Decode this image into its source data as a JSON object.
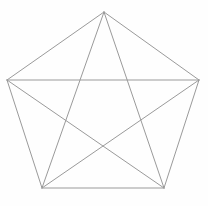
{
  "figure": {
    "shape_name": "pentagon-with-diagonals",
    "graph_name": "K5",
    "background_color": "#fefefe",
    "line_color": "#9a9a9a",
    "line_width": 1,
    "canvas": {
      "width": 208,
      "height": 206
    }
  },
  "chart_data": {
    "type": "diagram",
    "grid": false,
    "legend": null,
    "xlim": [
      0,
      208
    ],
    "ylim": [
      0,
      206
    ],
    "vertex_count": 5,
    "edge_count": 10,
    "side_count": 5,
    "diagonal_count": 5,
    "vertices": [
      {
        "id": "A",
        "label": "apex",
        "x": 104,
        "y": 12
      },
      {
        "id": "B",
        "label": "right",
        "x": 199,
        "y": 80
      },
      {
        "id": "C",
        "label": "bottom-right",
        "x": 164,
        "y": 188
      },
      {
        "id": "D",
        "label": "bottom-left",
        "x": 42,
        "y": 188
      },
      {
        "id": "E",
        "label": "left",
        "x": 7,
        "y": 80
      }
    ],
    "edges": [
      {
        "id": "side-AB",
        "kind": "side",
        "from": "A",
        "to": "B",
        "x1": 104,
        "y1": 12,
        "x2": 199,
        "y2": 80
      },
      {
        "id": "side-BC",
        "kind": "side",
        "from": "B",
        "to": "C",
        "x1": 199,
        "y1": 80,
        "x2": 164,
        "y2": 188
      },
      {
        "id": "side-CD",
        "kind": "side",
        "from": "C",
        "to": "D",
        "x1": 164,
        "y1": 188,
        "x2": 42,
        "y2": 188
      },
      {
        "id": "side-DE",
        "kind": "side",
        "from": "D",
        "to": "E",
        "x1": 42,
        "y1": 188,
        "x2": 7,
        "y2": 80
      },
      {
        "id": "side-EA",
        "kind": "side",
        "from": "E",
        "to": "A",
        "x1": 7,
        "y1": 80,
        "x2": 104,
        "y2": 12
      },
      {
        "id": "diagonal-AC",
        "kind": "diagonal",
        "from": "A",
        "to": "C",
        "x1": 104,
        "y1": 12,
        "x2": 164,
        "y2": 188
      },
      {
        "id": "diagonal-AD",
        "kind": "diagonal",
        "from": "A",
        "to": "D",
        "x1": 104,
        "y1": 12,
        "x2": 42,
        "y2": 188
      },
      {
        "id": "diagonal-BD",
        "kind": "diagonal",
        "from": "B",
        "to": "D",
        "x1": 199,
        "y1": 80,
        "x2": 42,
        "y2": 188
      },
      {
        "id": "diagonal-BE",
        "kind": "diagonal",
        "from": "B",
        "to": "E",
        "x1": 199,
        "y1": 80,
        "x2": 7,
        "y2": 80
      },
      {
        "id": "diagonal-CE",
        "kind": "diagonal",
        "from": "C",
        "to": "E",
        "x1": 164,
        "y1": 188,
        "x2": 7,
        "y2": 80
      }
    ]
  }
}
